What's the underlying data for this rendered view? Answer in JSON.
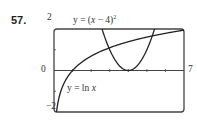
{
  "problem_number": "57.",
  "chart_data": {
    "type": "line",
    "title": "",
    "xlabel": "",
    "ylabel": "",
    "xlim": [
      0,
      7
    ],
    "ylim": [
      -2,
      2
    ],
    "x_tick_labels": {
      "min": "0",
      "max": "7"
    },
    "y_tick_labels": {
      "max": "2",
      "min": "-2"
    },
    "x_ticks": [
      1,
      2,
      3,
      4,
      5,
      6
    ],
    "y_ticks": [
      -1,
      1
    ],
    "grid": false,
    "series": [
      {
        "name": "y = ln x",
        "label_prefix": "y = ln ",
        "label_var": "x",
        "function": "ln(x)",
        "x": [
          0.135,
          0.25,
          0.5,
          1,
          1.5,
          2,
          3,
          4,
          5,
          6,
          7
        ],
        "y": [
          -2.0,
          -1.386,
          -0.693,
          0,
          0.405,
          0.693,
          1.099,
          1.386,
          1.609,
          1.792,
          1.946
        ]
      },
      {
        "name": "y = (x - 4)^2",
        "label_prefix": "y = (",
        "label_var": "x",
        "label_suffix": " − 4)",
        "label_exp": "2",
        "function": "(x-4)^2",
        "x": [
          2.586,
          3,
          3.5,
          4,
          4.5,
          5,
          5.414
        ],
        "y": [
          2.0,
          1.0,
          0.25,
          0,
          0.25,
          1.0,
          2.0
        ]
      }
    ],
    "annotations": [
      "y = (x − 4)²",
      "y = ln x"
    ]
  }
}
